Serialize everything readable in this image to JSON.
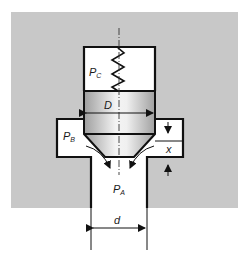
{
  "diagram": {
    "labels": {
      "pc": {
        "main": "P",
        "sub": "C"
      },
      "pb": {
        "main": "P",
        "sub": "B"
      },
      "pa": {
        "main": "P",
        "sub": "A"
      },
      "D": "D",
      "d": "d",
      "x": "x"
    },
    "colors": {
      "body_fill": "#c8c8c8",
      "cavity_fill": "#ffffff",
      "outline": "#111111",
      "piston_light": "#f2f2f2",
      "piston_dark": "#9a9a9a"
    }
  }
}
